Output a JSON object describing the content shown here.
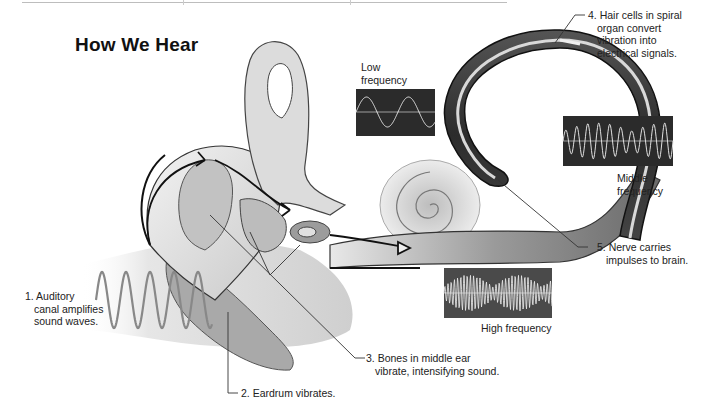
{
  "title": "How We Hear",
  "labels": {
    "step1": {
      "line1": "1. Auditory",
      "line2": "canal amplifies",
      "line3": "sound waves."
    },
    "step2": {
      "line1": "2. Eardrum vibrates."
    },
    "step3": {
      "line1": "3. Bones in middle ear",
      "line2": "vibrate, intensifying sound."
    },
    "step4": {
      "line1": "4. Hair cells in spiral",
      "line2": "organ convert",
      "line3": "vibration into",
      "line4": "electrical signals."
    },
    "step5": {
      "line1": "5. Nerve carries",
      "line2": "impulses to brain."
    }
  },
  "frequency_panels": {
    "low": {
      "line1": "Low",
      "line2": "frequency"
    },
    "middle": {
      "line1": "Middle",
      "line2": "frequency"
    },
    "high": {
      "line1": "High frequency"
    }
  },
  "colors": {
    "panel_bg": "#2b2b2b",
    "wave_line": "#d8d8d8",
    "tissue": "#d9d9d9",
    "tube_dark": "#3a3a3a"
  }
}
